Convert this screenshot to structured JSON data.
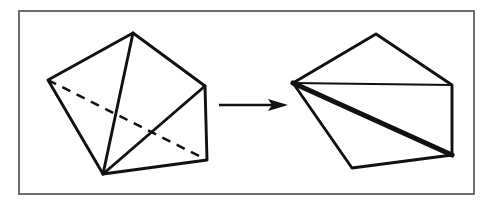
{
  "figure": {
    "caption": "",
    "background_color": "#ffffff",
    "ink_color": "#111111",
    "frame_color": "#4a4a4a",
    "canvas": {
      "width": 497,
      "height": 209
    },
    "frame": {
      "x": 19,
      "y": 11,
      "width": 455,
      "height": 183,
      "stroke_width": 1.6
    },
    "panels": [
      {
        "name": "left-panel",
        "role": "folded-polyhedron",
        "description": "Three-dimensional wireframe polyhedron drawn in oblique view with one hidden edge shown dashed",
        "vertices": {
          "left": [
            48,
            80
          ],
          "top": [
            133,
            33
          ],
          "right_upper": [
            205,
            86
          ],
          "right_lower": [
            207,
            160
          ],
          "bottom": [
            103,
            174
          ]
        },
        "outline_path": "M 48 80 L 133 33 L 205 86 L 207 160 L 103 174 Z",
        "visible_edges": [
          {
            "name": "edge-bottom-to-top",
            "path": "M 103 174 L 133 33"
          },
          {
            "name": "edge-bottom-to-right-upper",
            "path": "M 103 174 L 205 86"
          }
        ],
        "hidden_edges": [
          {
            "name": "edge-left-to-right-lower-hidden",
            "path": "M 48 80 L 207 160",
            "style": "dashed"
          }
        ]
      },
      {
        "name": "right-panel",
        "role": "unfolded-net",
        "description": "Flattened planar net of the same polyhedron with the unfolded crease drawn as a bold line",
        "vertices": {
          "left": [
            293,
            83
          ],
          "top": [
            376,
            34
          ],
          "right_upper": [
            452,
            85
          ],
          "right_lower": [
            452,
            155
          ],
          "bottom": [
            352,
            168
          ]
        },
        "outline_path": "M 293 83 L 376 34 L 452 85 L 452 155 L 352 168 Z",
        "visible_edges": [
          {
            "name": "edge-left-to-right-upper",
            "path": "M 293 83 L 452 85",
            "style": "thin"
          }
        ],
        "bold_edges": [
          {
            "name": "edge-left-to-right-lower-crease",
            "path": "M 293 83 L 452 155",
            "style": "bold"
          }
        ]
      }
    ],
    "arrow": {
      "name": "transform-arrow",
      "label": "",
      "from": [
        219,
        105
      ],
      "to": [
        288,
        105
      ],
      "shaft_path": "M 219 105 L 275 105",
      "head_path": "M 288 105 L 268 99 L 272 105 L 268 111 Z",
      "direction": "left-to-right"
    }
  }
}
